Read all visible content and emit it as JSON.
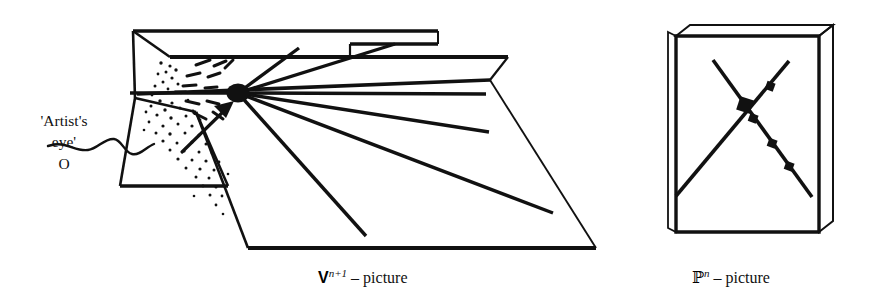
{
  "figure": {
    "kind": "line-diagram",
    "background_color": "#ffffff",
    "ink_color": "#111111",
    "width": 880,
    "height": 300
  },
  "annotations": {
    "eye_label_line1": "'Artist's",
    "eye_label_line2": "eye'",
    "eye_label_line3": "O"
  },
  "captions": {
    "left": {
      "symbol": "V",
      "superscript": "n+1",
      "separator": "–",
      "word": "picture"
    },
    "right": {
      "symbol": "ℙ",
      "superscript": "n",
      "separator": "–",
      "word": "picture"
    }
  },
  "left_panel": {
    "name": "V^{n+1}-picture",
    "description": "Two intersecting planes in oblique projection with rays radiating from the artist's eye point O",
    "eye_point": {
      "cx": 238,
      "cy": 93,
      "rx": 11.5,
      "ry": 9.5
    },
    "upper_plane": "M 168 30 L 348 30 L 348 46 L 296 46 L 296 60 L 158 60 L 130 30 Z",
    "top_plane_outline": [
      [
        132,
        31
      ],
      [
        438,
        31
      ],
      [
        438,
        43
      ],
      [
        348,
        43
      ],
      [
        348,
        57
      ],
      [
        164,
        57
      ]
    ],
    "front_plane_outline": [
      [
        170,
        57
      ],
      [
        508,
        57
      ],
      [
        508,
        76
      ],
      [
        490,
        95
      ],
      [
        592,
        250
      ],
      [
        248,
        250
      ],
      [
        135,
        98
      ]
    ],
    "left_vertical_plane": [
      [
        132,
        31
      ],
      [
        170,
        57
      ],
      [
        135,
        98
      ],
      [
        215,
        186
      ],
      [
        120,
        186
      ]
    ],
    "rays": [
      {
        "from": [
          238,
          93
        ],
        "to": [
          298,
          48
        ]
      },
      {
        "from": [
          238,
          93
        ],
        "to": [
          392,
          44
        ]
      },
      {
        "from": [
          238,
          93
        ],
        "to": [
          118,
          93
        ]
      },
      {
        "from": [
          238,
          93
        ],
        "to": [
          486,
          94
        ]
      },
      {
        "from": [
          238,
          93
        ],
        "to": [
          487,
          131
        ]
      },
      {
        "from": [
          238,
          93
        ],
        "to": [
          551,
          212
        ]
      },
      {
        "from": [
          238,
          93
        ],
        "to": [
          366,
          235
        ]
      }
    ],
    "dash_burst_count": 12,
    "stipple_dot_count": 58,
    "arrow_tail": [
      187,
      152
    ],
    "arrow_head": [
      230,
      105
    ],
    "pointer_squiggle": "wavy leader line from label to the plane"
  },
  "right_panel": {
    "name": "P^n-picture",
    "description": "Square slab (thin 3D plate) containing two crossing straight lines; the descending line carries marked points",
    "slab_front": [
      [
        676,
        35
      ],
      [
        818,
        35
      ],
      [
        818,
        232
      ],
      [
        676,
        232
      ]
    ],
    "slab_top": [
      [
        676,
        35
      ],
      [
        690,
        24
      ],
      [
        832,
        24
      ],
      [
        818,
        35
      ]
    ],
    "slab_side": [
      [
        818,
        35
      ],
      [
        832,
        24
      ],
      [
        832,
        221
      ],
      [
        818,
        232
      ]
    ],
    "line_rising": {
      "from": [
        675,
        196
      ],
      "to": [
        788,
        62
      ]
    },
    "line_descending": {
      "from": [
        796,
        57
      ],
      "to": [
        812,
        198
      ]
    },
    "marked_points": [
      {
        "cx": 745,
        "cy": 105,
        "size": 11,
        "role": "intersection"
      },
      {
        "cx": 770,
        "cy": 86,
        "size": 7,
        "role": "point"
      },
      {
        "cx": 753,
        "cy": 118,
        "size": 7,
        "role": "point"
      },
      {
        "cx": 772,
        "cy": 143,
        "size": 7,
        "role": "point"
      },
      {
        "cx": 789,
        "cy": 166,
        "size": 7,
        "role": "point"
      }
    ]
  }
}
